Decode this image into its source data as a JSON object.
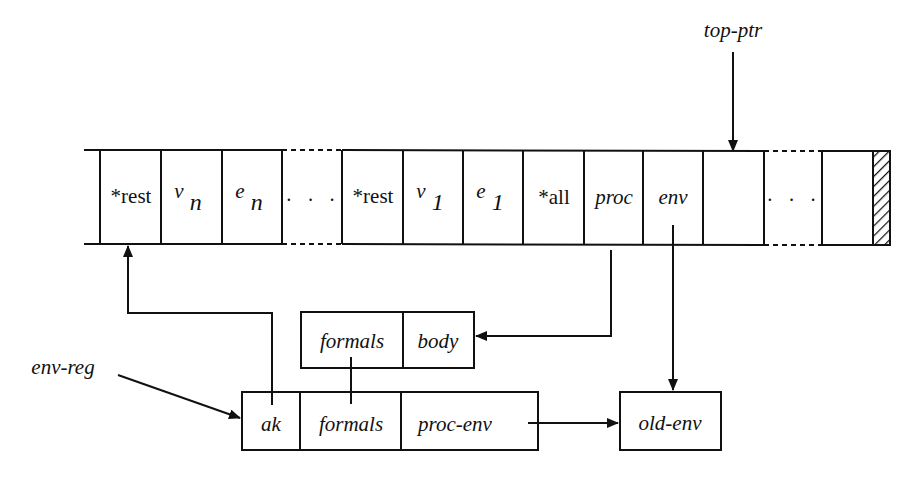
{
  "diagram": {
    "title": "",
    "stack": {
      "cells": [
        {
          "id": "rest-n",
          "label": "*rest",
          "italic": false
        },
        {
          "id": "v-n",
          "label": "v",
          "sub": "n",
          "italic": true
        },
        {
          "id": "e-n",
          "label": "e",
          "sub": "n",
          "italic": true
        },
        {
          "id": "gap-1",
          "label": "· · ·",
          "italic": false,
          "dashed_border": true
        },
        {
          "id": "rest-1",
          "label": "*rest",
          "italic": false
        },
        {
          "id": "v-1",
          "label": "v",
          "sub": "1",
          "italic": true
        },
        {
          "id": "e-1",
          "label": "e",
          "sub": "1",
          "italic": true
        },
        {
          "id": "all",
          "label": "*all",
          "italic": false
        },
        {
          "id": "proc",
          "label": "proc",
          "italic": true
        },
        {
          "id": "env",
          "label": "env",
          "italic": true
        },
        {
          "id": "empty",
          "label": "",
          "italic": false
        },
        {
          "id": "gap-2",
          "label": "· · ·",
          "italic": false,
          "dashed_border": true
        },
        {
          "id": "last",
          "label": "",
          "italic": false
        },
        {
          "id": "hatched-end",
          "label": "",
          "hatched": true
        }
      ]
    },
    "pointers": {
      "top_ptr": "top-ptr",
      "env_reg": "env-reg"
    },
    "closure_record": {
      "fields": [
        "formals",
        "body"
      ]
    },
    "env_record": {
      "fields": [
        "ak",
        "formals",
        "proc-env"
      ]
    },
    "old_env_record": {
      "fields": [
        "old-env"
      ]
    },
    "edges": [
      {
        "from": "top-ptr",
        "to": "empty cell (stack top)"
      },
      {
        "from": "proc",
        "to": "closure_record.body"
      },
      {
        "from": "env",
        "to": "old-env"
      },
      {
        "from": "ak",
        "to": "rest-n"
      },
      {
        "from": "env-reg",
        "to": "ak"
      },
      {
        "from": "proc-env",
        "to": "old-env"
      },
      {
        "from": "closure_record.formals",
        "to": "env_record.formals"
      }
    ],
    "colors": {
      "line": "#111111",
      "background": "#ffffff"
    }
  }
}
